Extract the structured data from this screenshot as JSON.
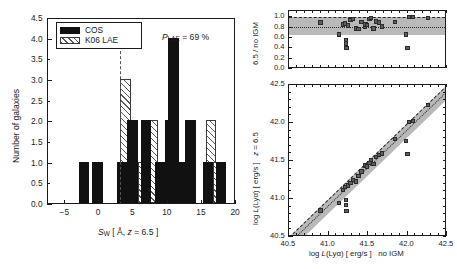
{
  "figure": {
    "panels": [
      "histogram",
      "ratio",
      "luminosity"
    ]
  },
  "chart_data": [
    {
      "type": "bar",
      "name": "equivalent-width-histogram",
      "title": "",
      "xlabel": "S_W [ A, z = 6.5 ]",
      "ylabel": "Number of galaxies",
      "xlim": [
        -7.5,
        20
      ],
      "ylim": [
        0,
        4.5
      ],
      "xticks": [
        -5,
        0,
        5,
        10,
        15,
        20
      ],
      "xticklabels": [
        "−5",
        "0",
        "5",
        "10",
        "15",
        "20"
      ],
      "yticks": [
        0.0,
        0.5,
        1.0,
        1.5,
        2.0,
        2.5,
        3.0,
        3.5,
        4.0,
        4.5
      ],
      "yticklabels": [
        "0.0",
        "0.5",
        "1.0",
        "1.5",
        "2.0",
        "2.5",
        "3.0",
        "3.5",
        "4.0",
        "4.5"
      ],
      "bin_width": 1.5,
      "grid": false,
      "legend_position": "upper-left",
      "annotation": "P_LAE = 69 %",
      "annotation_label": "P",
      "annotation_sub": "LAE",
      "annotation_value": "= 69 %",
      "vline": 3.0,
      "series": [
        {
          "name": "COS",
          "fill": "solid",
          "color": "#111111",
          "bins": [
            {
              "x0": -3.0,
              "value": 1
            },
            {
              "x0": -1.0,
              "value": 1
            },
            {
              "x0": 2.6,
              "value": 1
            },
            {
              "x0": 4.1,
              "value": 2
            },
            {
              "x0": 6.1,
              "value": 2
            },
            {
              "x0": 8.1,
              "value": 1
            },
            {
              "x0": 9.6,
              "value": 2
            },
            {
              "x0": 10.1,
              "value": 4
            },
            {
              "x0": 11.6,
              "value": 1
            },
            {
              "x0": 12.6,
              "value": 2
            },
            {
              "x0": 15.1,
              "value": 1
            },
            {
              "x0": 17.1,
              "value": 1
            }
          ]
        },
        {
          "name": "K06 LAE",
          "fill": "hatched",
          "color": "#5a5a5a",
          "bins": [
            {
              "x0": 3.1,
              "value": 3
            },
            {
              "x0": 4.6,
              "value": 1
            },
            {
              "x0": 5.6,
              "value": 1
            },
            {
              "x0": 7.1,
              "value": 2
            },
            {
              "x0": 8.6,
              "value": 1
            },
            {
              "x0": 11.1,
              "value": 1
            },
            {
              "x0": 12.1,
              "value": 1
            },
            {
              "x0": 15.6,
              "value": 2
            },
            {
              "x0": 16.6,
              "value": 1
            }
          ]
        }
      ]
    },
    {
      "type": "scatter",
      "name": "igm-transmission-ratio",
      "title": "",
      "xlabel": "",
      "ylabel": "6.5 / no IGM",
      "xlim": [
        40.5,
        42.5
      ],
      "ylim": [
        0.0,
        1.12
      ],
      "xticks": [
        40.5,
        41.0,
        41.5,
        42.0,
        42.5
      ],
      "xticklabels": [
        "",
        "",
        "",
        "",
        ""
      ],
      "yticks": [
        0.0,
        0.2,
        0.4,
        0.6,
        0.8,
        1.0
      ],
      "yticklabels": [
        "0.0",
        "0.2",
        "0.4",
        "0.6",
        "0.8",
        "1.0"
      ],
      "grid": false,
      "band": {
        "ymin": 0.65,
        "ymax": 1.0,
        "color": "#b9b9b9"
      },
      "dashed_line": {
        "y": 1.0
      },
      "dotted_line": {
        "y": 0.82
      },
      "points": [
        {
          "x": 40.9,
          "y": 0.9
        },
        {
          "x": 41.13,
          "y": 0.67
        },
        {
          "x": 41.18,
          "y": 0.86
        },
        {
          "x": 41.21,
          "y": 0.88
        },
        {
          "x": 41.22,
          "y": 0.55
        },
        {
          "x": 41.22,
          "y": 0.49
        },
        {
          "x": 41.23,
          "y": 0.41
        },
        {
          "x": 41.25,
          "y": 0.84
        },
        {
          "x": 41.28,
          "y": 0.95
        },
        {
          "x": 41.31,
          "y": 0.96
        },
        {
          "x": 41.35,
          "y": 0.78
        },
        {
          "x": 41.38,
          "y": 0.77
        },
        {
          "x": 41.42,
          "y": 0.91
        },
        {
          "x": 41.46,
          "y": 0.81
        },
        {
          "x": 41.47,
          "y": 0.86
        },
        {
          "x": 41.49,
          "y": 0.85
        },
        {
          "x": 41.52,
          "y": 0.96
        },
        {
          "x": 41.54,
          "y": 0.99
        },
        {
          "x": 41.57,
          "y": 0.78
        },
        {
          "x": 41.6,
          "y": 0.92
        },
        {
          "x": 41.64,
          "y": 0.9
        },
        {
          "x": 41.68,
          "y": 0.82
        },
        {
          "x": 41.84,
          "y": 0.91
        },
        {
          "x": 41.98,
          "y": 0.67
        },
        {
          "x": 42.0,
          "y": 0.4
        },
        {
          "x": 42.02,
          "y": 1.0
        },
        {
          "x": 42.07,
          "y": 1.0
        },
        {
          "x": 42.26,
          "y": 0.98
        }
      ]
    },
    {
      "type": "scatter",
      "name": "lyman-alpha-luminosity",
      "title": "",
      "xlabel": "log L(Lyα) [ erg/s ]    no IGM",
      "xlabel_part1": "log",
      "xlabel_part2": "L",
      "xlabel_part3": "(Lyα) [ erg/s ]",
      "xlabel_part4": "no IGM",
      "ylabel": "log L(Lyα) [ erg/s ]    z = 6.5",
      "ylabel_part1": "log",
      "ylabel_part2": "L",
      "ylabel_part3": "(Lyα) [ erg/s ]",
      "ylabel_part4": "z",
      "ylabel_part5": "= 6.5",
      "xlim": [
        40.5,
        42.5
      ],
      "ylim": [
        40.5,
        42.5
      ],
      "xticks": [
        40.5,
        41.0,
        41.5,
        42.0,
        42.5
      ],
      "xticklabels": [
        "40.5",
        "41.0",
        "41.5",
        "42.0",
        "42.5"
      ],
      "yticks": [
        40.5,
        41.0,
        41.5,
        42.0,
        42.5
      ],
      "yticklabels": [
        "40.5",
        "41.0",
        "41.5",
        "42.0",
        "42.5"
      ],
      "grid": false,
      "band": {
        "offset_low": -0.19,
        "offset_high": 0.0,
        "color": "#b9b9b9"
      },
      "dashed_line": {
        "slope": 1,
        "intercept": 0.0
      },
      "dotted_line": {
        "slope": 1,
        "intercept": -0.085
      },
      "points": [
        {
          "x": 40.9,
          "y": 40.85
        },
        {
          "x": 41.13,
          "y": 40.95
        },
        {
          "x": 41.18,
          "y": 41.12
        },
        {
          "x": 41.21,
          "y": 41.16
        },
        {
          "x": 41.22,
          "y": 40.99
        },
        {
          "x": 41.22,
          "y": 40.92
        },
        {
          "x": 41.23,
          "y": 40.84
        },
        {
          "x": 41.25,
          "y": 41.18
        },
        {
          "x": 41.28,
          "y": 41.21
        },
        {
          "x": 41.31,
          "y": 41.25
        },
        {
          "x": 41.35,
          "y": 41.23
        },
        {
          "x": 41.38,
          "y": 41.3
        },
        {
          "x": 41.42,
          "y": 41.36
        },
        {
          "x": 41.46,
          "y": 41.44
        },
        {
          "x": 41.47,
          "y": 41.45
        },
        {
          "x": 41.49,
          "y": 41.43
        },
        {
          "x": 41.52,
          "y": 41.47
        },
        {
          "x": 41.54,
          "y": 41.51
        },
        {
          "x": 41.57,
          "y": 41.46
        },
        {
          "x": 41.6,
          "y": 41.55
        },
        {
          "x": 41.64,
          "y": 41.58
        },
        {
          "x": 41.68,
          "y": 41.6
        },
        {
          "x": 41.84,
          "y": 41.79
        },
        {
          "x": 41.98,
          "y": 41.76
        },
        {
          "x": 42.0,
          "y": 41.59
        },
        {
          "x": 42.02,
          "y": 42.01
        },
        {
          "x": 42.07,
          "y": 42.03
        },
        {
          "x": 42.26,
          "y": 42.24
        }
      ]
    }
  ]
}
